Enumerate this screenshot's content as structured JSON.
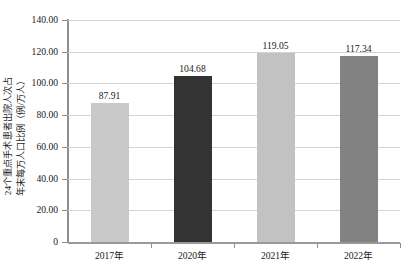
{
  "chart_data": {
    "type": "bar",
    "title": "",
    "xlabel": "",
    "ylabel": "24个重点手术患者出院人次占年末每万人口比例（例/万人）",
    "ylabel_line1": "24个重点手术患者出院人次占",
    "ylabel_line2": "年末每万人口比例（例/万人）",
    "categories": [
      "2017年",
      "2020年",
      "2021年",
      "2022年"
    ],
    "values": [
      87.91,
      104.68,
      119.05,
      117.34
    ],
    "value_labels": [
      "87.91",
      "104.68",
      "119.05",
      "117.34"
    ],
    "bar_colors": [
      "#c9c9c9",
      "#333333",
      "#c2c2c2",
      "#828282"
    ],
    "ylim": [
      0,
      140
    ],
    "ytick_values": [
      0,
      20,
      40,
      60,
      80,
      100,
      120,
      140
    ],
    "ytick_labels": [
      "0",
      "20.00",
      "40.00",
      "60.00",
      "80.00",
      "100.00",
      "120.00",
      "140.00"
    ],
    "grid": "horizontal",
    "legend": "none",
    "axis_color": "#8f8f8f",
    "gridline_color": "#d4d4d4",
    "background": "#ffffff"
  }
}
